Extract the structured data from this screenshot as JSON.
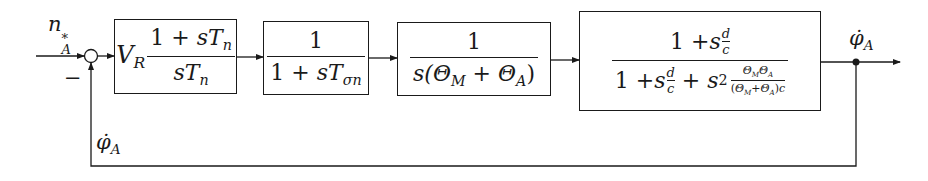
{
  "diagram": {
    "type": "block-diagram",
    "title": "",
    "colors": {
      "line": "#1a1a1a",
      "background": "#ffffff"
    },
    "input": {
      "label_base": "n",
      "label_sub": "A",
      "label_sup": "*"
    },
    "summing_junction": {
      "feedback_sign": "−"
    },
    "blocks": [
      {
        "id": "controller",
        "gain": {
          "base": "V",
          "sub": "R"
        },
        "numerator": {
          "a": "1 + ",
          "s": "s",
          "T": "T",
          "sub": "n"
        },
        "denominator": {
          "s": "s",
          "T": "T",
          "sub": "n"
        }
      },
      {
        "id": "lag",
        "numerator": "1",
        "denominator": {
          "a": "1 + ",
          "s": "s",
          "T": "T",
          "sub": "σn"
        }
      },
      {
        "id": "integrator",
        "numerator": "1",
        "denominator": {
          "pre": "s(",
          "th1": "Θ",
          "sub1": "M",
          "plus": " + ",
          "th2": "Θ",
          "sub2": "A",
          "post": ")"
        }
      },
      {
        "id": "mechanics",
        "numerator": {
          "a": "1 + ",
          "s": "s",
          "d": "d",
          "c": "c"
        },
        "denominator": {
          "a": "1 + ",
          "s": "s",
          "d": "d",
          "c": "c",
          "plus": " + ",
          "s2": "s",
          "pow": "2",
          "inner_num": {
            "th1": "Θ",
            "sub1": "M",
            "th2": "Θ",
            "sub2": "A"
          },
          "inner_den": {
            "pre": "(",
            "th1": "Θ",
            "sub1": "M",
            "plus": "+",
            "th2": "Θ",
            "sub2": "A",
            "post": ")",
            "c": "c"
          }
        }
      }
    ],
    "output": {
      "label_base": "φ̇",
      "label_sub": "A"
    },
    "feedback": {
      "label_base": "φ̇",
      "label_sub": "A"
    }
  }
}
